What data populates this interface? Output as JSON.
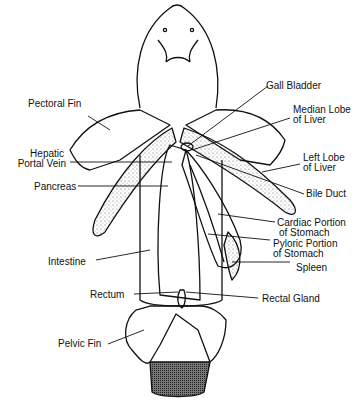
{
  "diagram": {
    "labels": {
      "pectoral_fin": "Pectoral Fin",
      "hepatic_portal_vein_1": "Hepatic",
      "hepatic_portal_vein_2": "Portal Vein",
      "pancreas": "Pancreas",
      "intestine": "Intestine",
      "rectum": "Rectum",
      "pelvic_fin": "Pelvic Fin",
      "gall_bladder": "Gall Bladder",
      "median_lobe_1": "Median Lobe",
      "median_lobe_2": "of Liver",
      "left_lobe_1": "Left Lobe",
      "left_lobe_2": "of Liver",
      "bile_duct": "Bile Duct",
      "cardiac_1": "Cardiac Portion",
      "cardiac_2": "of Stomach",
      "pyloric_1": "Pyloric Portion",
      "pyloric_2": "of Stomach",
      "spleen": "Spleen",
      "rectal_gland": "Rectal Gland"
    },
    "colors": {
      "ink": "#111111",
      "background": "#ffffff",
      "stipple": "#555555"
    }
  }
}
